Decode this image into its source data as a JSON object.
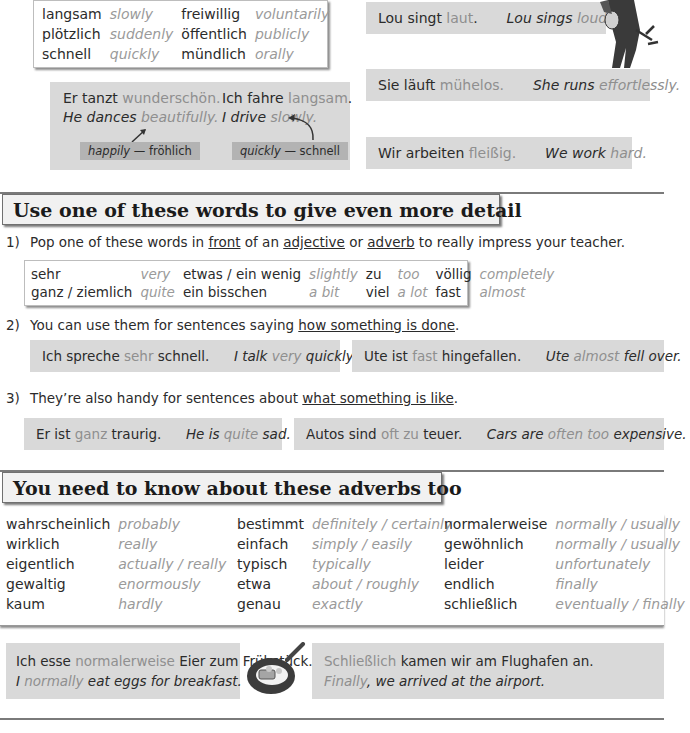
{
  "top": {
    "vocab_box": {
      "rows": [
        [
          {
            "de": "langsam",
            "en": "slowly"
          },
          {
            "de": "freiwillig",
            "en": "voluntarily"
          }
        ],
        [
          {
            "de": "plötzlich",
            "en": "suddenly"
          },
          {
            "de": "öffentlich",
            "en": "publicly"
          }
        ],
        [
          {
            "de": "schnell",
            "en": "quickly"
          },
          {
            "de": "mündlich",
            "en": "orally"
          }
        ]
      ]
    },
    "example_box": {
      "left": {
        "de_pre": "Er tanzt ",
        "de_hl": "wunderschön",
        "de_post": ".",
        "en_pre": "He dances ",
        "en_hl": "beautifully",
        "en_post": ".",
        "tag_en": "happily",
        "tag_sep": " — ",
        "tag_de": "fröhlich"
      },
      "right": {
        "de_pre": "Ich fahre ",
        "de_hl": "langsam",
        "de_post": ".",
        "en_pre": "I drive ",
        "en_hl": "slowly",
        "en_post": ".",
        "tag_en": "quickly",
        "tag_sep": " — ",
        "tag_de": "schnell"
      }
    },
    "sentences": [
      {
        "de_pre": "Lou singt ",
        "de_hl": "laut",
        "de_post": ".",
        "en_pre": "Lou sings ",
        "en_hl": "loudly",
        "en_post": "."
      },
      {
        "de_pre": "Sie läuft ",
        "de_hl": "mühelos",
        "de_post": ".",
        "en_pre": "She runs ",
        "en_hl": "effortlessly",
        "en_post": "."
      },
      {
        "de_pre": "Wir arbeiten ",
        "de_hl": "fleißig",
        "de_post": ".",
        "en_pre": "We work ",
        "en_hl": "hard",
        "en_post": "."
      }
    ]
  },
  "section1": {
    "heading": "Use one of these words to give even more detail",
    "point1": {
      "num": "1)",
      "pre": "Pop one of these words in ",
      "u1": "front",
      "mid1": " of an ",
      "u2": "adjective",
      "mid2": " or ",
      "u3": "adverb",
      "post": " to really impress your teacher."
    },
    "vocab": {
      "rows": [
        [
          {
            "de": "sehr",
            "en": "very"
          },
          {
            "de": "etwas / ein wenig",
            "en": "slightly"
          },
          {
            "de": "zu",
            "en": "too"
          },
          {
            "de": "völlig",
            "en": "completely"
          }
        ],
        [
          {
            "de": "ganz / ziemlich",
            "en": "quite"
          },
          {
            "de": "ein bisschen",
            "en": "a bit"
          },
          {
            "de": "viel",
            "en": "a lot"
          },
          {
            "de": "fast",
            "en": "almost"
          }
        ]
      ]
    },
    "point2": {
      "num": "2)",
      "pre": "You can use them for sentences saying ",
      "u": "how something is done",
      "post": "."
    },
    "examples2": [
      {
        "de_pre": "Ich spreche ",
        "de_hl": "sehr",
        "de_post": " schnell.",
        "en_pre": "I talk ",
        "en_hl": "very",
        "en_post": " quickly."
      },
      {
        "de_pre": "Ute ist ",
        "de_hl": "fast",
        "de_post": " hingefallen.",
        "en_pre": "Ute ",
        "en_hl": "almost",
        "en_post": " fell over."
      }
    ],
    "point3": {
      "num": "3)",
      "pre": "They’re also handy for sentences about ",
      "u": "what something is like",
      "post": "."
    },
    "examples3": [
      {
        "de_pre": "Er ist ",
        "de_hl": "ganz",
        "de_post": " traurig.",
        "en_pre": "He is ",
        "en_hl": "quite",
        "en_post": " sad."
      },
      {
        "de_pre": "Autos sind ",
        "de_hl": "oft zu",
        "de_post": " teuer.",
        "en_pre": "Cars are ",
        "en_hl": "often too",
        "en_post": " expensive."
      }
    ]
  },
  "section2": {
    "heading": "You need to know about these adverbs too",
    "columns": [
      [
        {
          "de": "wahrscheinlich",
          "en": "probably"
        },
        {
          "de": "wirklich",
          "en": "really"
        },
        {
          "de": "eigentlich",
          "en": "actually / really"
        },
        {
          "de": "gewaltig",
          "en": "enormously"
        },
        {
          "de": "kaum",
          "en": "hardly"
        }
      ],
      [
        {
          "de": "bestimmt",
          "en": "definitely / certainly"
        },
        {
          "de": "einfach",
          "en": "simply / easily"
        },
        {
          "de": "typisch",
          "en": "typically"
        },
        {
          "de": "etwa",
          "en": "about / roughly"
        },
        {
          "de": "genau",
          "en": "exactly"
        }
      ],
      [
        {
          "de": "normalerweise",
          "en": "normally / usually"
        },
        {
          "de": "gewöhnlich",
          "en": "normally / usually"
        },
        {
          "de": "leider",
          "en": "unfortunately"
        },
        {
          "de": "endlich",
          "en": "finally"
        },
        {
          "de": "schließlich",
          "en": "eventually / finally"
        }
      ]
    ],
    "examples": [
      {
        "l1_pre": "Ich esse ",
        "l1_hl": "normalerweise",
        "l1_post": " Eier zum Frühstück.",
        "l2_pre": "I ",
        "l2_hl": "normally",
        "l2_post": " eat eggs for breakfast."
      },
      {
        "l1_pre": "",
        "l1_hl": "Schließlich",
        "l1_post": " kamen wir am Flughafen an.",
        "l2_pre": "",
        "l2_hl": "Finally",
        "l2_post": ", we arrived at the airport."
      }
    ]
  },
  "illustrations": {
    "singer": "rock-singer-illustration",
    "pan": "frying-pan-eggs-illustration"
  }
}
